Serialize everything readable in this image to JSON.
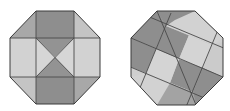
{
  "figure": {
    "colors": {
      "dark": "#8c8c8c",
      "medium": "#a9a9a9",
      "light": "#cfcfcf",
      "lighter": "#dcdcdc",
      "stroke": "#3a3a3a",
      "background": "#ffffff"
    },
    "left_octagon": {
      "vertices": [
        [
          36,
          11
        ],
        [
          74,
          11
        ],
        [
          100,
          38
        ],
        [
          100,
          77
        ],
        [
          74,
          104
        ],
        [
          36,
          104
        ],
        [
          10,
          77
        ],
        [
          10,
          38
        ]
      ],
      "center": [
        55,
        57
      ]
    },
    "right_octagon": {
      "vertices": [
        [
          157,
          11
        ],
        [
          195,
          11
        ],
        [
          223,
          38
        ],
        [
          223,
          77
        ],
        [
          195,
          105
        ],
        [
          157,
          105
        ],
        [
          131,
          77
        ],
        [
          131,
          38
        ]
      ],
      "center": [
        178,
        58
      ]
    }
  }
}
